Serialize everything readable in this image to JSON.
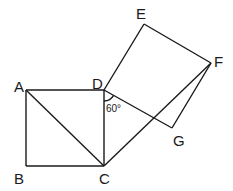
{
  "diagram": {
    "points": {
      "A": {
        "label": "A",
        "x": 26,
        "y": 90
      },
      "B": {
        "label": "B",
        "x": 26,
        "y": 166
      },
      "C": {
        "label": "C",
        "x": 104,
        "y": 166
      },
      "D": {
        "label": "D",
        "x": 104,
        "y": 90
      },
      "E": {
        "label": "E",
        "x": 144,
        "y": 24
      },
      "F": {
        "label": "F",
        "x": 211,
        "y": 63
      },
      "G": {
        "label": "G",
        "x": 172,
        "y": 128
      }
    },
    "segments": [
      "AB",
      "BC",
      "CD",
      "DA",
      "AC",
      "DE",
      "EF",
      "FG",
      "GD",
      "CF"
    ],
    "angle": {
      "vertex": "D",
      "between": [
        "DC",
        "DG"
      ],
      "label": "60°"
    }
  }
}
